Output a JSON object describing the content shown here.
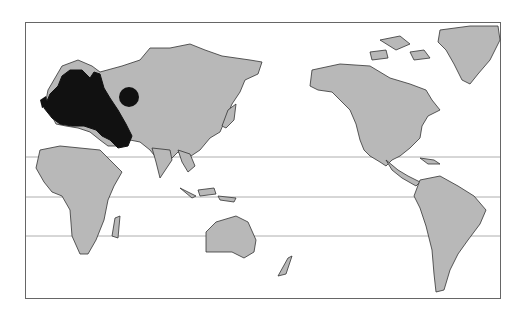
{
  "map": {
    "type": "world-map",
    "projection": "pacific-centered",
    "frame": {
      "x": 25,
      "y": 22,
      "width": 476,
      "height": 277
    },
    "latitude_lines_y": [
      157,
      197,
      236
    ],
    "colors": {
      "background": "#ffffff",
      "land": "#b8b8b8",
      "border": "#333333",
      "highlight": "#111111",
      "frame": "#666666"
    },
    "highlighted_region": {
      "name": "Europe",
      "description": "Black-shaded region covering Europe to the Caspian/Black Sea"
    },
    "marker": {
      "shape": "circle",
      "cx": 129,
      "cy": 97,
      "r": 10,
      "color": "#111111"
    },
    "continents": [
      "Eurasia",
      "Africa",
      "Australia",
      "North America",
      "South America",
      "Greenland",
      "New Zealand"
    ]
  }
}
